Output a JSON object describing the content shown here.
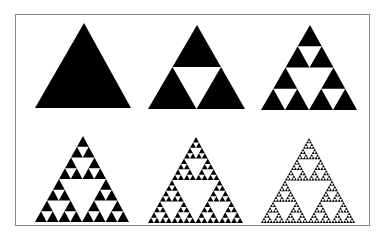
{
  "figure": {
    "colors": {
      "fill": "#000000",
      "background": "#ffffff",
      "border": "#8a8a8a"
    },
    "panels": [
      {
        "label": "iteration-0",
        "depth": 0,
        "apex": [
          84,
          23
        ],
        "base_left": [
          35,
          108
        ],
        "base_right": [
          131,
          108
        ]
      },
      {
        "label": "iteration-1",
        "depth": 1,
        "apex": [
          197,
          25
        ],
        "base_left": [
          148,
          109
        ],
        "base_right": [
          245,
          109
        ]
      },
      {
        "label": "iteration-2",
        "depth": 2,
        "apex": [
          310,
          25
        ],
        "base_left": [
          261,
          110
        ],
        "base_right": [
          357,
          110
        ]
      },
      {
        "label": "iteration-3",
        "depth": 3,
        "apex": [
          83,
          136
        ],
        "base_left": [
          35,
          222
        ],
        "base_right": [
          129,
          222
        ]
      },
      {
        "label": "iteration-4",
        "depth": 4,
        "apex": [
          196,
          137
        ],
        "base_left": [
          148,
          223
        ],
        "base_right": [
          243,
          223
        ]
      },
      {
        "label": "iteration-5",
        "depth": 5,
        "apex": [
          309,
          138
        ],
        "base_left": [
          261,
          223
        ],
        "base_right": [
          355,
          223
        ]
      }
    ]
  }
}
